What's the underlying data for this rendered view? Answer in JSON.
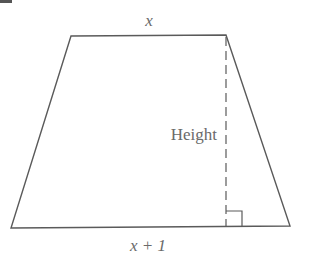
{
  "diagram": {
    "type": "trapezoid",
    "labels": {
      "top_base": "x",
      "bottom_base": "x + 1",
      "height": "Height"
    },
    "corner_mark": "2",
    "colors": {
      "stroke": "#5a5a5a",
      "text": "#6a6a6a",
      "background": "#ffffff"
    }
  }
}
